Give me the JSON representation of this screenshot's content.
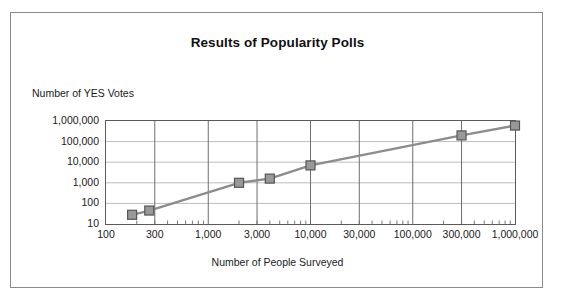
{
  "figure": {
    "title": "Results of Popularity Polls",
    "y_axis_title": "Number of YES Votes",
    "x_axis_title": "Number of People Surveyed"
  },
  "style": {
    "series_line_color": "#8c8c8c",
    "marker_fill_color": "#999999",
    "marker_border_color": "#555555",
    "plot_border_color": "#5a5a5a",
    "major_gridline_color": "#6e6e6e",
    "minor_gridline_color": "#bdbdbd",
    "frame_border_color": "#8a8a8a",
    "text_color": "#1a1a1a",
    "background_color": "#ffffff"
  },
  "chart_data": {
    "type": "line",
    "title": "Results of Popularity Polls",
    "xlabel": "Number of People Surveyed",
    "ylabel": "Number of YES Votes",
    "xscale": "log",
    "yscale": "log",
    "xlim": [
      100,
      1000000
    ],
    "ylim": [
      10,
      1000000
    ],
    "grid": true,
    "legend": "none",
    "xticks": [
      100,
      300,
      1000,
      3000,
      10000,
      30000,
      100000,
      300000,
      1000000
    ],
    "xticklabels": [
      "100",
      "300",
      "1,000",
      "3,000",
      "10,000",
      "30,000",
      "100,000",
      "300,000",
      "1,000,000"
    ],
    "yticks": [
      10,
      100,
      1000,
      10000,
      100000,
      1000000
    ],
    "yticklabels": [
      "10",
      "100",
      "1,000",
      "10,000",
      "100,000",
      "1,000,000"
    ],
    "marker": "square",
    "series": [
      {
        "name": "Poll results",
        "x": [
          180,
          265,
          2000,
          4000,
          10000,
          300000,
          1000000
        ],
        "y": [
          28,
          45,
          1000,
          1600,
          7000,
          200000,
          600000
        ]
      }
    ]
  }
}
